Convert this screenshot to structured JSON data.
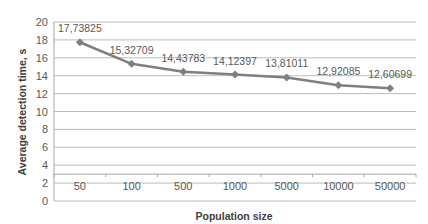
{
  "chart_data": {
    "type": "line",
    "title": "",
    "xlabel": "Population size",
    "ylabel": "Average detection time, s",
    "categories": [
      "50",
      "100",
      "500",
      "1000",
      "5000",
      "10000",
      "50000"
    ],
    "series": [
      {
        "name": "Average detection time",
        "values": [
          17.73825,
          15.32709,
          14.43783,
          14.12397,
          13.81011,
          12.92085,
          12.60699
        ]
      }
    ],
    "data_labels": [
      "17,73825",
      "15,32709",
      "14,43783",
      "14,12397",
      "13,81011",
      "12,92085",
      "12,60699"
    ],
    "ylim": [
      0,
      20
    ],
    "yticks": [
      0,
      2,
      4,
      6,
      8,
      10,
      12,
      14,
      16,
      18,
      20
    ],
    "x_axis_crosses_at": 3,
    "grid": true,
    "legend": "none",
    "line_color": "#7f7f7f",
    "marker": "diamond"
  }
}
